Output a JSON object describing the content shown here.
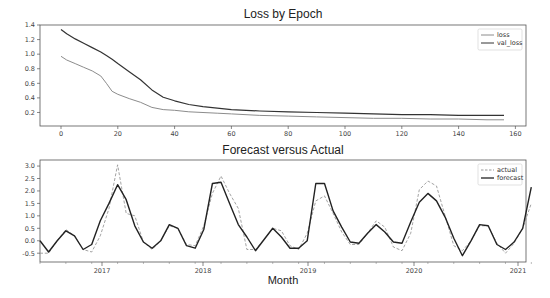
{
  "chart_data": [
    {
      "type": "line",
      "title": "Loss by Epoch",
      "xlabel": "",
      "ylabel": "",
      "xlim": [
        -8,
        162
      ],
      "ylim": [
        0.0,
        1.4
      ],
      "xticks": [
        0,
        20,
        40,
        60,
        80,
        100,
        120,
        140,
        160
      ],
      "yticks": [
        0.2,
        0.4,
        0.6,
        0.8,
        1.0,
        1.2,
        1.4
      ],
      "ytick_labels": [
        "0.2",
        "0.4",
        "0.6",
        "0.8",
        "1.0",
        "1.2",
        "1.4"
      ],
      "grid": false,
      "legend_position": "upper right",
      "x": [
        0,
        2,
        5,
        8,
        11,
        14,
        16,
        18,
        20,
        24,
        28,
        32,
        36,
        40,
        45,
        50,
        55,
        60,
        70,
        80,
        90,
        100,
        110,
        120,
        130,
        140,
        150,
        156
      ],
      "series": [
        {
          "name": "loss",
          "color": "#8c8c8c",
          "style": "solid",
          "values": [
            0.97,
            0.92,
            0.87,
            0.82,
            0.77,
            0.7,
            0.6,
            0.49,
            0.45,
            0.39,
            0.34,
            0.27,
            0.24,
            0.23,
            0.21,
            0.2,
            0.19,
            0.18,
            0.16,
            0.15,
            0.14,
            0.13,
            0.12,
            0.12,
            0.11,
            0.11,
            0.1,
            0.1
          ]
        },
        {
          "name": "val_loss",
          "color": "#333333",
          "style": "solid",
          "values": [
            1.34,
            1.28,
            1.21,
            1.15,
            1.09,
            1.03,
            0.98,
            0.93,
            0.87,
            0.76,
            0.65,
            0.51,
            0.41,
            0.36,
            0.31,
            0.28,
            0.26,
            0.24,
            0.22,
            0.21,
            0.2,
            0.19,
            0.18,
            0.17,
            0.17,
            0.16,
            0.16,
            0.16
          ]
        }
      ]
    },
    {
      "type": "line",
      "title": "Forecast versus Actual",
      "xlabel": "Month",
      "ylabel": "",
      "ylim": [
        -0.85,
        3.2
      ],
      "yticks": [
        -0.5,
        0.0,
        0.5,
        1.0,
        1.5,
        2.0,
        2.5,
        3.0
      ],
      "ytick_labels": [
        "-0.5",
        "0.0",
        "0.5",
        "1.0",
        "1.5",
        "2.0",
        "2.5",
        "3.0"
      ],
      "xtick_labels": [
        "2017",
        "2018",
        "2019",
        "2020",
        "2021"
      ],
      "grid": false,
      "legend_position": "upper right",
      "x_month_index": [
        0,
        1,
        2,
        3,
        4,
        5,
        6,
        7,
        8,
        9,
        10,
        11,
        12,
        13,
        14,
        15,
        16,
        17,
        18,
        19,
        20,
        21,
        22,
        23,
        24,
        25,
        26,
        27,
        28,
        29,
        30,
        31,
        32,
        33,
        34,
        35,
        36,
        37,
        38,
        39,
        40,
        41,
        42,
        43,
        44,
        45,
        46,
        47,
        48,
        49,
        50,
        51,
        52,
        53,
        54,
        55,
        56,
        57
      ],
      "x_start_label": "2016-06",
      "series": [
        {
          "name": "actual",
          "color": "#999999",
          "style": "dashed",
          "values": [
            -0.5,
            -0.5,
            0.0,
            0.45,
            0.2,
            -0.35,
            -0.45,
            0.2,
            1.3,
            3.05,
            1.1,
            1.0,
            -0.05,
            -0.35,
            0.0,
            0.6,
            0.5,
            -0.15,
            -0.2,
            0.6,
            1.9,
            2.6,
            1.9,
            1.3,
            -0.35,
            -0.35,
            0.05,
            0.5,
            0.4,
            -0.2,
            -0.35,
            0.3,
            1.6,
            1.8,
            1.1,
            0.35,
            -0.15,
            -0.15,
            0.3,
            0.8,
            0.55,
            -0.25,
            -0.4,
            0.3,
            2.05,
            2.4,
            2.2,
            1.0,
            -0.2,
            -0.4,
            0.0,
            0.6,
            0.6,
            -0.1,
            -0.5,
            -0.1,
            0.5,
            1.5
          ]
        },
        {
          "name": "forecast",
          "color": "#222222",
          "style": "solid",
          "values": [
            0.0,
            -0.45,
            0.0,
            0.4,
            0.2,
            -0.35,
            -0.15,
            0.8,
            1.5,
            2.25,
            1.65,
            0.6,
            -0.05,
            -0.3,
            0.0,
            0.65,
            0.5,
            -0.2,
            -0.3,
            0.45,
            2.3,
            2.35,
            1.5,
            0.65,
            0.15,
            -0.4,
            0.05,
            0.5,
            0.15,
            -0.3,
            -0.3,
            0.0,
            2.3,
            2.3,
            1.2,
            0.55,
            -0.05,
            -0.1,
            0.3,
            0.65,
            0.35,
            -0.05,
            -0.1,
            0.75,
            1.55,
            1.9,
            1.6,
            0.95,
            0.1,
            -0.6,
            0.0,
            0.65,
            0.6,
            -0.15,
            -0.35,
            -0.05,
            0.5,
            2.15
          ]
        }
      ]
    }
  ],
  "labels": {
    "chart1_title": "Loss by Epoch",
    "chart2_title": "Forecast versus Actual",
    "chart2_xlabel": "Month",
    "legend1": [
      "loss",
      "val_loss"
    ],
    "legend2": [
      "actual",
      "forecast"
    ]
  }
}
